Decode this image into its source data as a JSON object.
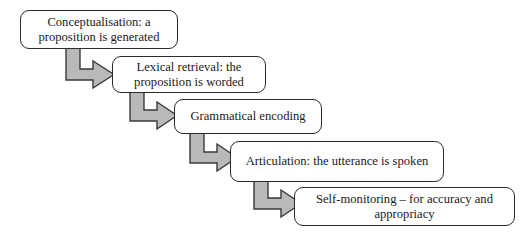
{
  "diagram": {
    "type": "stepped-flowchart",
    "background_color": "#ffffff",
    "box_fill": "#ffffff",
    "box_border_color": "#2b2b2b",
    "arrow_fill": "#b9b9b9",
    "arrow_border_color": "#3a3a3a",
    "text_color": "#1a1a1a",
    "nodes": [
      {
        "id": "conceptualisation",
        "label": "Conceptualisation: a proposition is generated",
        "x": 20,
        "y": 10,
        "width": 158,
        "height": 39
      },
      {
        "id": "lexical-retrieval",
        "label": "Lexical retrieval: the proposition is worded",
        "x": 112,
        "y": 56,
        "width": 154,
        "height": 37
      },
      {
        "id": "grammatical-encoding",
        "label": "Grammatical encoding",
        "x": 174,
        "y": 99,
        "width": 148,
        "height": 35
      },
      {
        "id": "articulation",
        "label": "Articulation: the utterance is spoken",
        "x": 230,
        "y": 141,
        "width": 214,
        "height": 41
      },
      {
        "id": "self-monitoring",
        "label": "Self-monitoring – for accuracy and appropriacy",
        "x": 294,
        "y": 187,
        "width": 221,
        "height": 39
      }
    ],
    "connectors": [
      {
        "id": "arrow-conceptualisation-to-lexical",
        "from": "conceptualisation",
        "to": "lexical-retrieval",
        "shape": "elbow-down-right"
      },
      {
        "id": "arrow-lexical-to-grammatical",
        "from": "lexical-retrieval",
        "to": "grammatical-encoding",
        "shape": "elbow-down-right"
      },
      {
        "id": "arrow-grammatical-to-articulation",
        "from": "grammatical-encoding",
        "to": "articulation",
        "shape": "elbow-down-right"
      },
      {
        "id": "arrow-articulation-to-self-monitoring",
        "from": "articulation",
        "to": "self-monitoring",
        "shape": "elbow-down-right"
      }
    ]
  }
}
